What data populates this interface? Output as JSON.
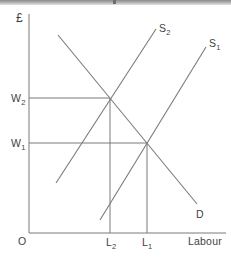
{
  "figure": {
    "title_hint": "labour-market-supply-demand-diagram",
    "y_axis_label": "£",
    "x_axis_label": "Labour",
    "origin_label": "O",
    "curves": {
      "s2": {
        "base": "S",
        "sub": "2"
      },
      "s1": {
        "base": "S",
        "sub": "1"
      },
      "d": {
        "base": "D",
        "sub": ""
      }
    },
    "markers": {
      "w2": {
        "base": "W",
        "sub": "2"
      },
      "w1": {
        "base": "W",
        "sub": "1"
      },
      "l2": {
        "base": "L",
        "sub": "2"
      },
      "l1": {
        "base": "L",
        "sub": "1"
      }
    },
    "colors": {
      "line": "#7a7a7a",
      "text": "#3f3f3f",
      "top_bar": "#8a8a8a",
      "background": "#ffffff"
    }
  }
}
